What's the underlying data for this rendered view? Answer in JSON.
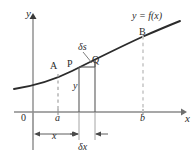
{
  "figure": {
    "kind": "mathematical-diagram",
    "topic": "arc-length-element-under-curve",
    "background_color": "#ffffff",
    "ink_color": "#2b2b2b",
    "axis_color": "#8a8a8a",
    "guide_color": "#a8a8a8",
    "light_guide_color": "#c9c9c9"
  },
  "axes": {
    "y_axis_label": "y",
    "x_axis_label": "x",
    "origin_label": "0",
    "x_ticks": [
      "a",
      "b"
    ]
  },
  "curve": {
    "equation_label": "y = f(x)",
    "equation_lhs": "y",
    "equation_eq": "=",
    "equation_rhs": "f(x)"
  },
  "points": [
    {
      "name": "A",
      "label": "A",
      "at": "a"
    },
    {
      "name": "P",
      "label": "P",
      "at": "x"
    },
    {
      "name": "Q",
      "label": "Q",
      "at": "x + δx"
    },
    {
      "name": "B",
      "label": "B",
      "at": "b"
    }
  ],
  "annotations": {
    "arc_element": "δs",
    "ordinate": "y",
    "abscissa_dimension": "x",
    "x_increment_dimension": "δx"
  }
}
